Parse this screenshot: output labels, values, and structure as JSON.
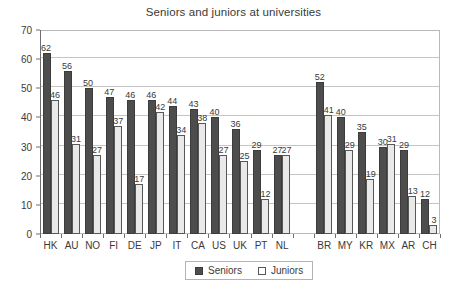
{
  "chart_data": {
    "type": "bar",
    "title": "Seniors and juniors at universities",
    "xlabel": "",
    "ylabel": "",
    "ylim": [
      0,
      70
    ],
    "yticks": [
      0,
      10,
      20,
      30,
      40,
      50,
      60,
      70
    ],
    "grid": true,
    "legend_position": "bottom",
    "categories": [
      "HK",
      "AU",
      "NO",
      "FI",
      "DE",
      "JP",
      "IT",
      "CA",
      "US",
      "UK",
      "PT",
      "NL",
      "",
      "BR",
      "MY",
      "KR",
      "MX",
      "AR",
      "CH"
    ],
    "series": [
      {
        "name": "Seniors",
        "color": "#4d4d4d",
        "values": [
          62,
          56,
          50,
          47,
          46,
          46,
          44,
          43,
          40,
          36,
          29,
          27,
          null,
          52,
          40,
          35,
          30,
          29,
          12
        ]
      },
      {
        "name": "Juniors",
        "color": "#e9e9e9",
        "values": [
          46,
          31,
          27,
          37,
          17,
          42,
          34,
          38,
          27,
          25,
          12,
          27,
          null,
          41,
          29,
          19,
          31,
          13,
          3
        ]
      }
    ]
  },
  "legend": {
    "items": [
      {
        "label": "Seniors",
        "kind": "seniors"
      },
      {
        "label": "Juniors",
        "kind": "juniors"
      }
    ]
  }
}
